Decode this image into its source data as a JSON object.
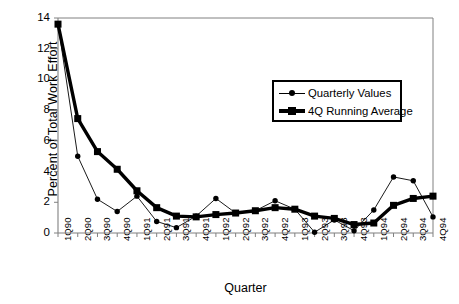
{
  "chart_data": {
    "type": "line",
    "title": "",
    "xlabel": "Quarter",
    "ylabel": "Percent of Total Work Effort",
    "categories": [
      "1Q90",
      "2Q90",
      "3Q90",
      "4Q90",
      "1Q91",
      "2Q91",
      "3Q91",
      "4Q91",
      "1Q92",
      "2Q92",
      "3Q92",
      "4Q92",
      "1Q93",
      "2Q93",
      "3Q93",
      "4Q93",
      "1Q94",
      "2Q94",
      "3Q94",
      "4Q94"
    ],
    "ylim": [
      0,
      14
    ],
    "yticks": [
      0,
      2,
      4,
      6,
      8,
      10,
      12,
      14
    ],
    "ytick_labels": [
      "0",
      "2",
      "4",
      "6",
      "8",
      "10",
      "12",
      "14"
    ],
    "grid": false,
    "legend_position": "upper-right-inside",
    "series": [
      {
        "name": "Quarterly Values",
        "marker": "circle",
        "line_width": "thin",
        "color": "#000000",
        "values": [
          13.6,
          5.0,
          2.2,
          1.4,
          2.4,
          0.75,
          0.35,
          1.1,
          2.25,
          1.3,
          1.45,
          2.1,
          1.55,
          0.05,
          0.85,
          0.15,
          1.5,
          3.65,
          3.4,
          1.05
        ]
      },
      {
        "name": "4Q Running Average",
        "marker": "square",
        "line_width": "thick",
        "color": "#000000",
        "values": [
          13.6,
          7.45,
          5.3,
          4.15,
          2.75,
          1.65,
          1.1,
          1.05,
          1.2,
          1.3,
          1.45,
          1.65,
          1.55,
          1.1,
          0.95,
          0.55,
          0.65,
          1.8,
          2.25,
          2.4
        ]
      }
    ]
  },
  "legend": {
    "items": [
      {
        "label": "Quarterly Values"
      },
      {
        "label": "4Q Running Average"
      }
    ]
  },
  "colors": {
    "ink": "#000000",
    "axis": "#808080",
    "background": "#ffffff"
  }
}
